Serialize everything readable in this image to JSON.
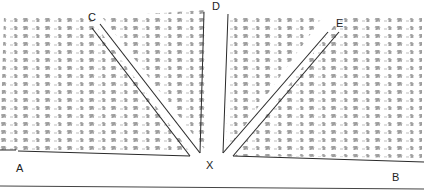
{
  "diagram": {
    "type": "rock-fracture-wedge-sketch",
    "labels": {
      "A": "A",
      "B": "B",
      "C": "C",
      "D": "D",
      "E": "E",
      "X": "X"
    },
    "colors": {
      "line": "#2a2a2a",
      "texture": "#444444",
      "background": "#ffffff"
    }
  }
}
